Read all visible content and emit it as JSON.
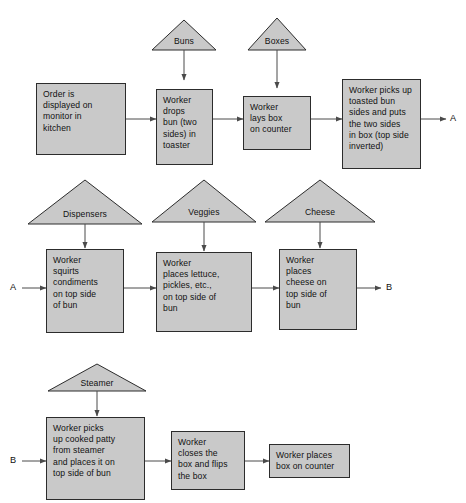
{
  "diagram": {
    "colors": {
      "shape_fill": "#c9c9c9",
      "shape_stroke": "#2c2c2c",
      "arrow": "#4a4a4a",
      "text": "#111111",
      "background": "#ffffff"
    },
    "rows": [
      {
        "id": "row-1",
        "inputs": [
          {
            "id": "buns",
            "label": "Buns"
          },
          {
            "id": "boxes",
            "label": "Boxes"
          }
        ],
        "steps": [
          {
            "id": "order-displayed",
            "text": "Order is\ndisplayed on\nmonitor in\nkitchen"
          },
          {
            "id": "worker-drops-bun",
            "text": "Worker\ndrops\nbun (two\nsides) in\ntoaster"
          },
          {
            "id": "worker-lays-box",
            "text": "Worker\nlays box\non counter"
          },
          {
            "id": "worker-picks-toasted-bun",
            "text": "Worker picks up\ntoasted bun\nsides and puts\nthe two sides\nin box (top side\ninverted)"
          }
        ],
        "exit_label": "A"
      },
      {
        "id": "row-2",
        "entry_label": "A",
        "inputs": [
          {
            "id": "dispensers",
            "label": "Dispensers"
          },
          {
            "id": "veggies",
            "label": "Veggies"
          },
          {
            "id": "cheese",
            "label": "Cheese"
          }
        ],
        "steps": [
          {
            "id": "worker-squirts-condiments",
            "text": "Worker\nsquirts\ncondiments\non top side\nof bun"
          },
          {
            "id": "worker-places-veggies",
            "text": "Worker\nplaces lettuce,\npickles, etc.,\non top side of\nbun"
          },
          {
            "id": "worker-places-cheese",
            "text": "Worker\nplaces\ncheese on\ntop side of\nbun"
          }
        ],
        "exit_label": "B"
      },
      {
        "id": "row-3",
        "entry_label": "B",
        "inputs": [
          {
            "id": "steamer",
            "label": "Steamer"
          }
        ],
        "steps": [
          {
            "id": "worker-picks-patty",
            "text": "Worker picks\nup cooked patty\nfrom steamer\nand places it on\ntop side of bun"
          },
          {
            "id": "worker-closes-box",
            "text": "Worker\ncloses the\nbox and flips\nthe box"
          },
          {
            "id": "worker-places-box",
            "text": "Worker places\nbox on counter"
          }
        ]
      }
    ]
  }
}
